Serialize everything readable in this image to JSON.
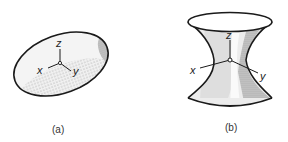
{
  "figure": {
    "panels": [
      {
        "id": "a",
        "shape": "ellipsoid",
        "caption": "(a)",
        "axes": {
          "x": "x",
          "y": "y",
          "z": "z"
        }
      },
      {
        "id": "b",
        "shape": "hyperboloid of one sheet",
        "caption": "(b)",
        "axes": {
          "x": "x",
          "y": "y",
          "z": "z"
        }
      }
    ]
  },
  "colors": {
    "outline": "#1a1a1a",
    "fill_light": "#ececec",
    "fill_mid": "#d6d6d6",
    "fill_dark": "#bdbdbd"
  }
}
